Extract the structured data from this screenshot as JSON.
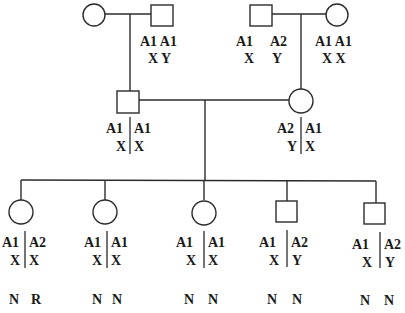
{
  "pedigree": {
    "generation1": {
      "left_couple": {
        "female": {
          "symbol": "circle",
          "genotype": null
        },
        "male": {
          "symbol": "square",
          "genotype": {
            "row1": "A1 A1",
            "row2": "X Y"
          }
        }
      },
      "right_couple": {
        "male": {
          "symbol": "square",
          "genotype": {
            "row1a": "A1",
            "row1b": "A2",
            "row2a": "X",
            "row2b": "Y"
          }
        },
        "female": {
          "symbol": "circle",
          "genotype": {
            "row1": "A1 A1",
            "row2": "X X"
          }
        }
      }
    },
    "generation2": {
      "male": {
        "symbol": "square",
        "haplotype_left": {
          "row1": "A1",
          "row2": "X"
        },
        "haplotype_right": {
          "row1": "A1",
          "row2": "X"
        }
      },
      "female": {
        "symbol": "circle",
        "haplotype_left": {
          "row1": "A2",
          "row2": "Y"
        },
        "haplotype_right": {
          "row1": "A1",
          "row2": "X"
        }
      }
    },
    "generation3": [
      {
        "symbol": "circle",
        "left": {
          "row1": "A1",
          "row2": "X"
        },
        "right": {
          "row1": "A2",
          "row2": "X"
        },
        "status": {
          "a": "N",
          "b": "R"
        }
      },
      {
        "symbol": "circle",
        "left": {
          "row1": "A1",
          "row2": "X"
        },
        "right": {
          "row1": "A1",
          "row2": "X"
        },
        "status": {
          "a": "N",
          "b": "N"
        }
      },
      {
        "symbol": "circle",
        "left": {
          "row1": "A1",
          "row2": "X"
        },
        "right": {
          "row1": "A1",
          "row2": "X"
        },
        "status": {
          "a": "N",
          "b": "N"
        }
      },
      {
        "symbol": "square",
        "left": {
          "row1": "A1",
          "row2": "X"
        },
        "right": {
          "row1": "A2",
          "row2": "Y"
        },
        "status": {
          "a": "N",
          "b": "N"
        }
      },
      {
        "symbol": "square",
        "left": {
          "row1": "A1",
          "row2": "X"
        },
        "right": {
          "row1": "A2",
          "row2": "Y"
        },
        "status": {
          "a": "N",
          "b": "N"
        }
      }
    ]
  }
}
